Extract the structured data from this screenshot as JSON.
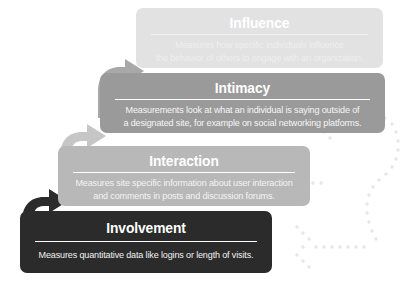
{
  "diagram": {
    "type": "staircase-pyramid",
    "levels": [
      {
        "id": "influence",
        "order": 4,
        "title": "Influence",
        "body_lines": [
          "Measures how specific individuals influence",
          "the behavior of others to engage with an organization."
        ],
        "color": "#e2e2e2",
        "text_color": "#ffffff"
      },
      {
        "id": "intimacy",
        "order": 3,
        "title": "Intimacy",
        "body_lines": [
          "Measurements look at what an individual is saying outside of",
          "a designated site, for example on social networking platforms."
        ],
        "color": "#9a9a9a",
        "text_color": "#ffffff"
      },
      {
        "id": "interaction",
        "order": 2,
        "title": "Interaction",
        "body_lines": [
          "Measures site specific information about user interaction",
          "and comments in posts and discussion forums."
        ],
        "color": "#b8b8b8",
        "text_color": "#ffffff"
      },
      {
        "id": "involvement",
        "order": 1,
        "title": "Involvement",
        "body_lines": [
          "Measures quantitative data like logins or length of visits."
        ],
        "color": "#2b2b2b",
        "text_color": "#ffffff"
      }
    ],
    "connectors": [
      {
        "id": "arrow-involvement-to-interaction",
        "from": "involvement",
        "to": "interaction",
        "color": "#2b2b2b"
      },
      {
        "id": "arrow-interaction-to-intimacy",
        "from": "interaction",
        "to": "intimacy",
        "color": "#c6c6c6"
      },
      {
        "id": "arrow-intimacy-to-influence",
        "from": "intimacy",
        "to": "influence",
        "color": "#a8a8a8"
      }
    ],
    "decoration": {
      "id": "dotted-feedback-arrows",
      "description": "Three dotted left-pointing arrows joined by a dotted curve on the right edge",
      "color": "#e6e6e6",
      "count": 3
    }
  }
}
